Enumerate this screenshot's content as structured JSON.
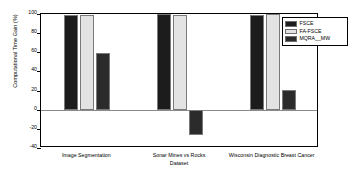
{
  "chart_data": {
    "type": "bar",
    "title": "",
    "xlabel": "Dataset",
    "ylabel": "Computational Time Gain (%)",
    "categories": [
      "Image Segmentation",
      "Sonar Mines vs Rocks",
      "Wisconsin Diagnostic Breast Cancer"
    ],
    "series": [
      {
        "name": "FSCE",
        "color": "#1c1c1c",
        "values": [
          99,
          100,
          99
        ]
      },
      {
        "name": "FA-FSCE",
        "color": "#e3e3e3",
        "values": [
          99,
          99,
          100
        ]
      },
      {
        "name": "MQRA__MW",
        "color": "#2b2b2b",
        "values": [
          59,
          -26,
          21
        ]
      }
    ],
    "ylim": [
      -40,
      100
    ],
    "yticks": [
      -40,
      -20,
      0,
      20,
      40,
      60,
      80,
      100
    ],
    "ytick_labels": [
      "-40",
      "-20",
      "0",
      "20",
      "40",
      "60",
      "80",
      "100"
    ],
    "grid": false,
    "legend_position": "upper right"
  },
  "legend": {
    "entries": [
      {
        "label": "FSCE"
      },
      {
        "label": "FA-FSCE"
      },
      {
        "label": "MQRA__MW"
      }
    ]
  }
}
